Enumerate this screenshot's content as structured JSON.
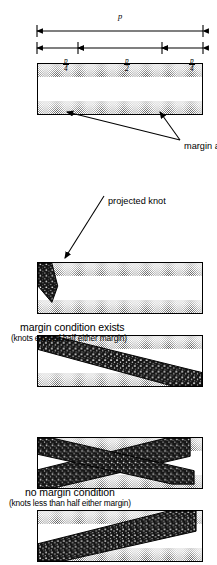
{
  "figure": {
    "ink_color": "#000000",
    "stipple_color": "#575757",
    "knot_color": "#1a1a1a"
  },
  "captions": [
    {
      "id": "margin-exists",
      "line1": "margin condition exists",
      "line2": "(knots exceed half either margin)"
    },
    {
      "id": "no-margin",
      "line1": "no margin condition",
      "line2": "(knots less than half either margin)"
    }
  ],
  "annotations": {
    "projected_knot": "projected knot",
    "margin_areas": "margin areas"
  },
  "dimensions": {
    "total": {
      "label": "p",
      "numerator": "",
      "denominator": ""
    },
    "quarter_left": {
      "numerator": "p",
      "denominator": "4"
    },
    "half": {
      "numerator": "p",
      "denominator": "2"
    },
    "quarter_right": {
      "numerator": "p",
      "denominator": "4"
    }
  },
  "panels": [
    {
      "id": "panel-margin-areas",
      "kind": "margin-areas",
      "knots": 0
    },
    {
      "id": "panel-projected-knot",
      "kind": "margin-exists",
      "knots": 1
    },
    {
      "id": "panel-margin-exists-wedge",
      "kind": "margin-exists",
      "knots": 1
    },
    {
      "id": "panel-no-margin-two",
      "kind": "no-margin",
      "knots": 2
    },
    {
      "id": "panel-no-margin-one",
      "kind": "no-margin",
      "knots": 1
    }
  ]
}
